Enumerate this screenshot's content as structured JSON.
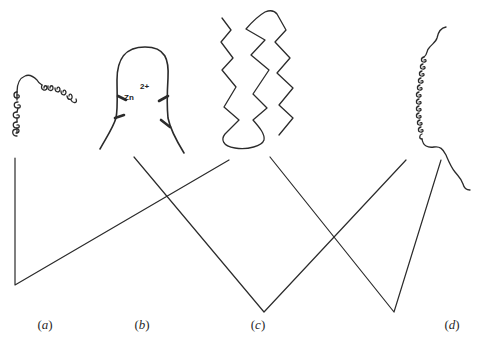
{
  "figure": {
    "panels": [
      {
        "id": "a",
        "label": "(a)",
        "label_x": 45,
        "motif": "helical coil structure"
      },
      {
        "id": "b",
        "label": "(b)",
        "label_x": 142,
        "motif": "zinc finger loop",
        "ion_symbol": "Zn",
        "ion_charge": "2+"
      },
      {
        "id": "c",
        "label": "(c)",
        "label_x": 258,
        "motif": "beta-sheet zigzag strands"
      },
      {
        "id": "d",
        "label": "(d)",
        "label_x": 452,
        "motif": "long helical coil with tails"
      }
    ],
    "label_y": 317,
    "stroke_color": "#2b2b2b",
    "background": "#ffffff"
  }
}
